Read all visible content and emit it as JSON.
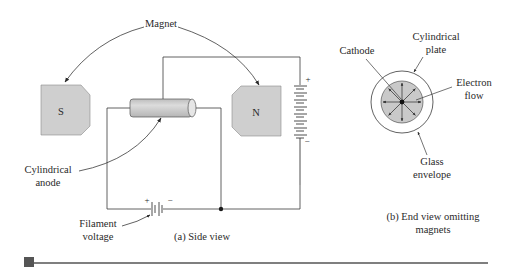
{
  "figure": {
    "side_view": {
      "caption": "(a) Side view",
      "labels": {
        "magnet": "Magnet",
        "south_pole": "S",
        "north_pole": "N",
        "cylindrical_anode_line1": "Cylindrical",
        "cylindrical_anode_line2": "anode",
        "filament_voltage_line1": "Filament",
        "filament_voltage_line2": "voltage",
        "battery_plus": "+",
        "battery_minus": "−",
        "filament_plus": "+",
        "filament_minus": "−"
      }
    },
    "end_view": {
      "caption_line1": "(b) End view omitting",
      "caption_line2": "magnets",
      "labels": {
        "cathode": "Cathode",
        "cylindrical_plate_line1": "Cylindrical",
        "cylindrical_plate_line2": "plate",
        "electron_flow_line1": "Electron",
        "electron_flow_line2": "flow",
        "glass_envelope_line1": "Glass",
        "glass_envelope_line2": "envelope"
      }
    },
    "colors": {
      "magnet_fill": "#cfcfcf",
      "line": "#3a3a3a",
      "footer_marker": "#555555"
    }
  }
}
